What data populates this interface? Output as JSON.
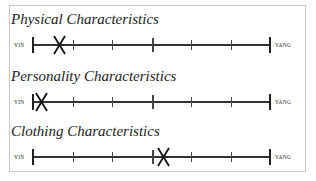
{
  "scales": [
    {
      "title": "Physical Characteristics",
      "left_label": "YIN",
      "right_label": "YANG",
      "marker_position": 0.65,
      "marker_icon": "x-mark"
    },
    {
      "title": "Personality Characteristics",
      "left_label": "YIN",
      "right_label": "YANG",
      "marker_position": 0.2,
      "marker_icon": "x-mark"
    },
    {
      "title": "Clothing Characteristics",
      "left_label": "YIN",
      "right_label": "YANG",
      "marker_position": 3.3,
      "marker_icon": "x-mark"
    }
  ],
  "scale_intervals": 6,
  "colors": {
    "line": "#333333",
    "border": "#c8c8c8"
  }
}
